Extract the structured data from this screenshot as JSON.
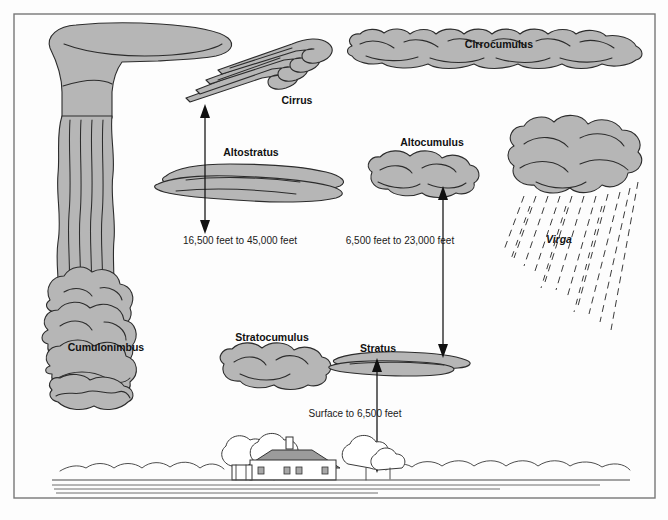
{
  "diagram": {
    "frame": {
      "x": 14,
      "y": 14,
      "width": 641,
      "height": 484
    },
    "colors": {
      "cloud_fill": "#b6b6b6",
      "cloud_stroke": "#2c2c2c",
      "frame_stroke": "#777777",
      "label_text": "#111111",
      "roof_fill": "#9b9b9b",
      "background": "#fdfdfd"
    }
  },
  "cloud_labels": [
    {
      "name": "cumulonimbus",
      "text": "Cumulonimbus",
      "x": 106,
      "y": 348,
      "style": "bold"
    },
    {
      "name": "cirrus",
      "text": "Cirrus",
      "x": 297,
      "y": 101,
      "style": "bold"
    },
    {
      "name": "cirrocumulus",
      "text": "Cirrocumulus",
      "x": 499,
      "y": 45,
      "style": "bold"
    },
    {
      "name": "altostratus",
      "text": "Altostratus",
      "x": 251,
      "y": 153,
      "style": "bold"
    },
    {
      "name": "altocumulus",
      "text": "Altocumulus",
      "x": 432,
      "y": 143,
      "style": "bold"
    },
    {
      "name": "stratocumulus",
      "text": "Stratocumulus",
      "x": 272,
      "y": 338,
      "style": "bold"
    },
    {
      "name": "stratus",
      "text": "Stratus",
      "x": 378,
      "y": 349,
      "style": "bold"
    },
    {
      "name": "virga",
      "text": "Virga",
      "x": 559,
      "y": 240,
      "style": "bold-italic"
    }
  ],
  "altitude_annotations": [
    {
      "name": "high-cloud-range",
      "text": "16,500 feet to 45,000 feet",
      "text_x": 240,
      "text_y": 241,
      "arrow": {
        "x": 205,
        "y_top": 110,
        "y_bottom": 228,
        "head_top": false,
        "head_bottom": true
      }
    },
    {
      "name": "middle-cloud-range",
      "text": "6,500 feet to 23,000 feet",
      "text_x": 400,
      "text_y": 241,
      "arrow": {
        "x": 443,
        "y_top": 186,
        "y_bottom": 358,
        "head_top": true,
        "head_bottom": true
      }
    },
    {
      "name": "low-cloud-range",
      "text": "Surface to 6,500 feet",
      "text_x": 355,
      "text_y": 414,
      "arrow": {
        "x": 377,
        "y_top": 358,
        "y_bottom": 473,
        "head_top": true,
        "head_bottom": true
      }
    }
  ],
  "landscape": {
    "name": "ground-scene",
    "house_label": "farmhouse",
    "tree_count": 4,
    "ground_lines": 4
  }
}
